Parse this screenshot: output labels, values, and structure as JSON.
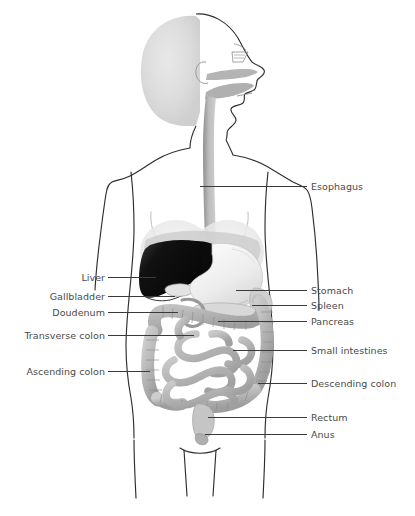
{
  "figure": {
    "type": "anatomy-diagram",
    "canvas": {
      "width": 415,
      "height": 516
    },
    "colors": {
      "outline": "#2e2e2e",
      "leader_line": "#3a3a3a",
      "label_text": "#4a4a4a",
      "background": "#ffffff",
      "liver_dark": "#111111",
      "stomach_light": "#f2f2f2",
      "organ_mid_gray": "#b9b9b9",
      "head_fill": "#dedede",
      "tract_gray": "#a8a8a8"
    }
  },
  "labels": {
    "right": [
      {
        "id": "esophagus",
        "text": "Esophagus",
        "text_x": 311,
        "text_y": 181,
        "line_x": 200,
        "line_y": 186,
        "line_w": 107
      },
      {
        "id": "stomach",
        "text": "Stomach",
        "text_x": 311,
        "text_y": 285,
        "line_x": 236,
        "line_y": 290,
        "line_w": 71
      },
      {
        "id": "spleen",
        "text": "Spleen",
        "text_x": 311,
        "text_y": 300,
        "line_x": 252,
        "line_y": 305,
        "line_w": 55
      },
      {
        "id": "pancreas",
        "text": "Pancreas",
        "text_x": 311,
        "text_y": 316,
        "line_x": 218,
        "line_y": 321,
        "line_w": 89
      },
      {
        "id": "small-intestines",
        "text": "Small intestines",
        "text_x": 311,
        "text_y": 345,
        "line_x": 233,
        "line_y": 350,
        "line_w": 74
      },
      {
        "id": "descending-colon",
        "text": "Descending colon",
        "text_x": 311,
        "text_y": 378,
        "line_x": 258,
        "line_y": 383,
        "line_w": 49
      },
      {
        "id": "rectum",
        "text": "Rectum",
        "text_x": 311,
        "text_y": 412,
        "line_x": 208,
        "line_y": 417,
        "line_w": 99
      },
      {
        "id": "anus",
        "text": "Anus",
        "text_x": 311,
        "text_y": 429,
        "line_x": 205,
        "line_y": 434,
        "line_w": 102
      }
    ],
    "left": [
      {
        "id": "liver",
        "text": "Liver",
        "text_right_x": 105,
        "text_y": 272,
        "line_x": 108,
        "line_y": 277,
        "line_w": 48
      },
      {
        "id": "gallbladder",
        "text": "Gallbladder",
        "text_right_x": 105,
        "text_y": 291,
        "line_x": 108,
        "line_y": 296,
        "line_w": 67
      },
      {
        "id": "doudenum",
        "text": "Doudenum",
        "text_right_x": 105,
        "text_y": 307,
        "line_x": 108,
        "line_y": 312,
        "line_w": 70
      },
      {
        "id": "transverse-colon",
        "text": "Transverse colon",
        "text_right_x": 105,
        "text_y": 330,
        "line_x": 108,
        "line_y": 335,
        "line_w": 86
      },
      {
        "id": "ascending-colon",
        "text": "Ascending colon",
        "text_right_x": 105,
        "text_y": 366,
        "line_x": 108,
        "line_y": 371,
        "line_w": 42
      }
    ]
  },
  "organs": [
    {
      "id": "head",
      "name": "head-profile"
    },
    {
      "id": "nasal-cavity",
      "name": "nasal-cavity"
    },
    {
      "id": "oral-cavity",
      "name": "oral-cavity-tongue"
    },
    {
      "id": "esophagus-tube",
      "name": "esophagus-tube"
    },
    {
      "id": "liver-shape",
      "name": "liver"
    },
    {
      "id": "gallbladder-shape",
      "name": "gallbladder"
    },
    {
      "id": "stomach-shape",
      "name": "stomach"
    },
    {
      "id": "duodenum-shape",
      "name": "duodenum"
    },
    {
      "id": "spleen-shape",
      "name": "spleen"
    },
    {
      "id": "pancreas-shape",
      "name": "pancreas"
    },
    {
      "id": "large-intestine",
      "name": "large-intestine-colon"
    },
    {
      "id": "small-intestine",
      "name": "small-intestine"
    },
    {
      "id": "rectum-shape",
      "name": "rectum"
    },
    {
      "id": "anus-shape",
      "name": "anus"
    },
    {
      "id": "body-outline",
      "name": "body-silhouette-outline"
    }
  ]
}
